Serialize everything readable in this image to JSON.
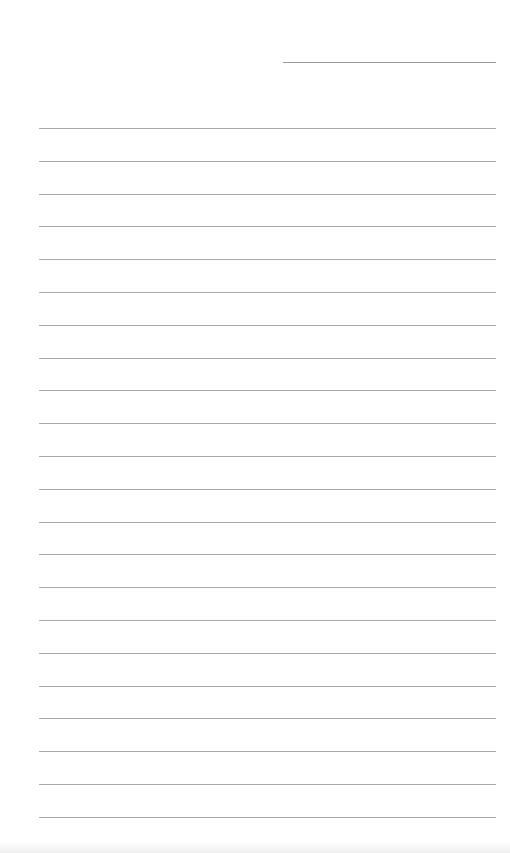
{
  "page": {
    "type": "lined-paper",
    "background_color": "#ffffff",
    "line_color": "#a9a9a9"
  },
  "date_line": {
    "x": 283,
    "y": 62,
    "width": 213
  },
  "rules": {
    "count": 22,
    "start_y": 128,
    "spacing": 32.8,
    "x": 39,
    "width": 457
  }
}
